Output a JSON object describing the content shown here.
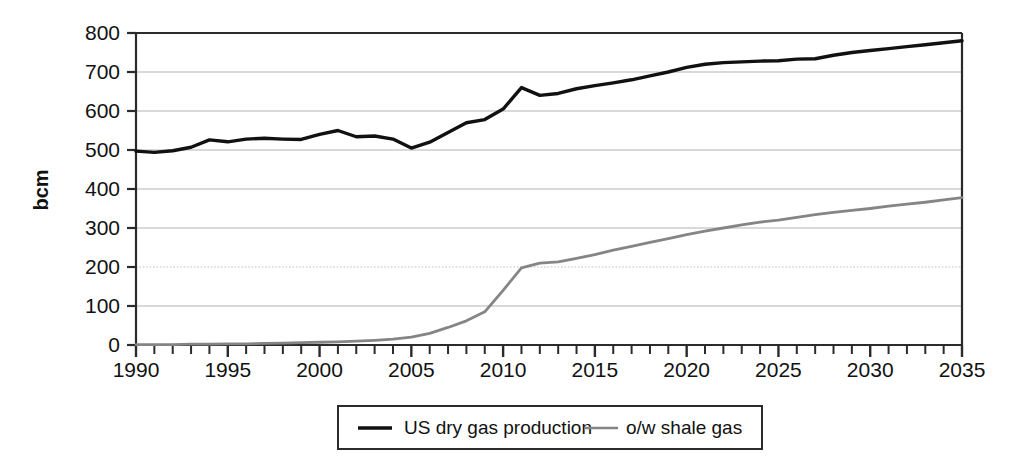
{
  "chart_data": {
    "type": "line",
    "title": "",
    "xlabel": "",
    "ylabel": "bcm",
    "xlim": [
      1990,
      2035
    ],
    "ylim": [
      0,
      800
    ],
    "grid": true,
    "legend_position": "bottom-center",
    "y_ticks": [
      0,
      100,
      200,
      300,
      400,
      500,
      600,
      700,
      800
    ],
    "x_ticks_major": [
      1990,
      1995,
      2000,
      2005,
      2010,
      2015,
      2020,
      2025,
      2030,
      2035
    ],
    "x_tick_interval_minor": 1,
    "x": [
      1990,
      1991,
      1992,
      1993,
      1994,
      1995,
      1996,
      1997,
      1998,
      1999,
      2000,
      2001,
      2002,
      2003,
      2004,
      2005,
      2006,
      2007,
      2008,
      2009,
      2010,
      2011,
      2012,
      2013,
      2014,
      2015,
      2016,
      2017,
      2018,
      2019,
      2020,
      2021,
      2022,
      2023,
      2024,
      2025,
      2026,
      2027,
      2028,
      2029,
      2030,
      2031,
      2032,
      2033,
      2034,
      2035
    ],
    "series": [
      {
        "name": "US dry gas production",
        "color": "#111111",
        "width": 3.4,
        "values": [
          497,
          494,
          498,
          507,
          526,
          521,
          528,
          530,
          528,
          527,
          540,
          550,
          534,
          536,
          528,
          505,
          520,
          545,
          570,
          578,
          605,
          660,
          640,
          645,
          657,
          665,
          672,
          680,
          690,
          700,
          712,
          720,
          724,
          726,
          728,
          729,
          733,
          734,
          743,
          750,
          755,
          760,
          765,
          770,
          775,
          780
        ]
      },
      {
        "name": "o/w shale gas",
        "color": "#858585",
        "width": 2.8,
        "values": [
          1,
          1,
          1,
          2,
          2,
          3,
          3,
          4,
          5,
          6,
          7,
          8,
          10,
          12,
          15,
          20,
          30,
          45,
          62,
          85,
          140,
          198,
          210,
          213,
          222,
          232,
          243,
          253,
          263,
          273,
          283,
          292,
          300,
          308,
          315,
          320,
          327,
          334,
          340,
          345,
          350,
          356,
          361,
          366,
          372,
          378
        ]
      }
    ]
  },
  "legend": {
    "items": [
      {
        "label": "US dry gas production",
        "color": "#111111"
      },
      {
        "label": "o/w shale gas",
        "color": "#858585"
      }
    ]
  },
  "axes": {
    "y_title": "bcm",
    "y_tick_labels": [
      "0",
      "100",
      "200",
      "300",
      "400",
      "500",
      "600",
      "700",
      "800"
    ],
    "x_tick_labels": [
      "1990",
      "1995",
      "2000",
      "2005",
      "2010",
      "2015",
      "2020",
      "2025",
      "2030",
      "2035"
    ]
  }
}
